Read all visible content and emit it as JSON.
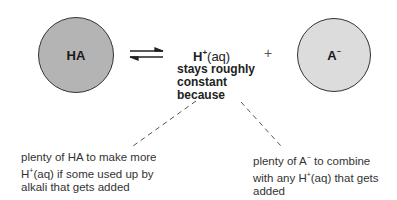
{
  "diagram": {
    "type": "buffer-equilibrium",
    "left_species": {
      "label": "HA",
      "fill": "#b4b4b4"
    },
    "equilibrium_arrow": "⇌",
    "center": {
      "species": "H",
      "charge": "+",
      "state": "(aq)",
      "caption_lines": [
        "stays roughly",
        "constant",
        "because"
      ]
    },
    "plus_sign": "+",
    "right_species": {
      "label": "A",
      "charge": "−",
      "fill": "#dcdcdc"
    },
    "notes": {
      "left": {
        "line1": "plenty of HA to make more",
        "line2_pre": "H",
        "line2_charge": "+",
        "line2_post": "(aq) if some used up by",
        "line3": "alkali that gets added"
      },
      "right": {
        "line1_pre": "plenty of A",
        "line1_charge": "−",
        "line1_post": " to combine",
        "line2_pre": "with any H",
        "line2_charge": "+",
        "line2_post": "(aq) that gets",
        "line3": "added"
      }
    }
  }
}
